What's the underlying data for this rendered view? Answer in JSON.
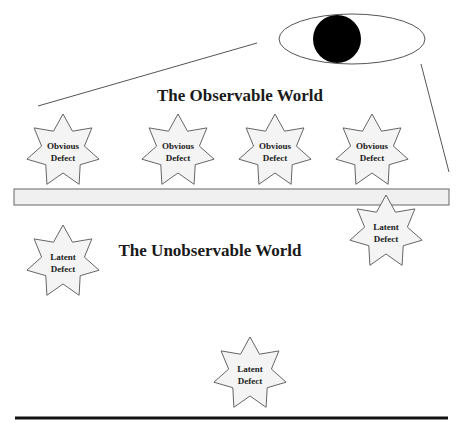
{
  "diagram": {
    "titles": {
      "observable": "The Observable World",
      "unobservable": "The Unobservable World"
    },
    "eye": {
      "cx": 352,
      "cy": 39,
      "rx": 73,
      "ry": 25,
      "pupil": {
        "cx": 337,
        "cy": 39,
        "r": 24
      }
    },
    "sight_lines": [
      {
        "x1": 38,
        "y1": 106,
        "x2": 257,
        "y2": 43
      },
      {
        "x1": 421,
        "y1": 64,
        "x2": 449,
        "y2": 172
      }
    ],
    "boundary_bar": {
      "x": 14,
      "y": 189,
      "width": 435,
      "height": 16,
      "fill": "#f0f0f0",
      "stroke": "#666666"
    },
    "ground_line": {
      "x1": 15,
      "y1": 418,
      "x2": 448,
      "y2": 418
    },
    "defects": [
      {
        "kind": "obvious",
        "line1": "Obvious",
        "line2": "Defect",
        "cx": 63,
        "cy": 151
      },
      {
        "kind": "obvious",
        "line1": "Obvious",
        "line2": "Defect",
        "cx": 178,
        "cy": 151
      },
      {
        "kind": "obvious",
        "line1": "Obvious",
        "line2": "Defect",
        "cx": 275,
        "cy": 151
      },
      {
        "kind": "obvious",
        "line1": "Obvious",
        "line2": "Defect",
        "cx": 372,
        "cy": 151
      },
      {
        "kind": "latent",
        "line1": "Latent",
        "line2": "Defect",
        "cx": 386,
        "cy": 232
      },
      {
        "kind": "latent",
        "line1": "Latent",
        "line2": "Defect",
        "cx": 63,
        "cy": 262
      },
      {
        "kind": "latent",
        "line1": "Latent",
        "line2": "Defect",
        "cx": 250,
        "cy": 374
      }
    ],
    "colors": {
      "pupil": "#000000",
      "outline": "#555555",
      "star_fill": "#f4f4f4",
      "ground": "#111111"
    }
  }
}
